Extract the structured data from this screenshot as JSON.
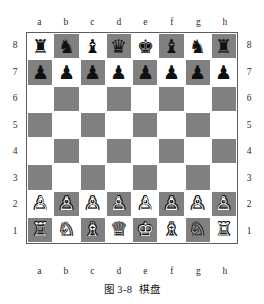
{
  "figure": {
    "caption_number": "图 3-8",
    "caption_title": "棋盘"
  },
  "board": {
    "files": [
      "a",
      "b",
      "c",
      "d",
      "e",
      "f",
      "g",
      "h"
    ],
    "ranks": [
      "8",
      "7",
      "6",
      "5",
      "4",
      "3",
      "2",
      "1"
    ],
    "light_color": "#ffffff",
    "dark_color": "#808080",
    "border_color": "#5e5e5e",
    "orientation": "white-bottom",
    "squares": [
      [
        {
          "square": "a8",
          "shade": "light",
          "piece": "black-rook",
          "glyph": "♜",
          "color": "black"
        },
        {
          "square": "b8",
          "shade": "dark",
          "piece": "black-knight",
          "glyph": "♞",
          "color": "black"
        },
        {
          "square": "c8",
          "shade": "light",
          "piece": "black-bishop",
          "glyph": "♝",
          "color": "black"
        },
        {
          "square": "d8",
          "shade": "dark",
          "piece": "black-queen",
          "glyph": "♛",
          "color": "black"
        },
        {
          "square": "e8",
          "shade": "light",
          "piece": "black-king",
          "glyph": "♚",
          "color": "black"
        },
        {
          "square": "f8",
          "shade": "dark",
          "piece": "black-bishop",
          "glyph": "♝",
          "color": "black"
        },
        {
          "square": "g8",
          "shade": "light",
          "piece": "black-knight",
          "glyph": "♞",
          "color": "black"
        },
        {
          "square": "h8",
          "shade": "dark",
          "piece": "black-rook",
          "glyph": "♜",
          "color": "black"
        }
      ],
      [
        {
          "square": "a7",
          "shade": "dark",
          "piece": "black-pawn",
          "glyph": "♟",
          "color": "black"
        },
        {
          "square": "b7",
          "shade": "light",
          "piece": "black-pawn",
          "glyph": "♟",
          "color": "black"
        },
        {
          "square": "c7",
          "shade": "dark",
          "piece": "black-pawn",
          "glyph": "♟",
          "color": "black"
        },
        {
          "square": "d7",
          "shade": "light",
          "piece": "black-pawn",
          "glyph": "♟",
          "color": "black"
        },
        {
          "square": "e7",
          "shade": "dark",
          "piece": "black-pawn",
          "glyph": "♟",
          "color": "black"
        },
        {
          "square": "f7",
          "shade": "light",
          "piece": "black-pawn",
          "glyph": "♟",
          "color": "black"
        },
        {
          "square": "g7",
          "shade": "dark",
          "piece": "black-pawn",
          "glyph": "♟",
          "color": "black"
        },
        {
          "square": "h7",
          "shade": "light",
          "piece": "black-pawn",
          "glyph": "♟",
          "color": "black"
        }
      ],
      [
        {
          "square": "a6",
          "shade": "light",
          "piece": null,
          "glyph": "",
          "color": null
        },
        {
          "square": "b6",
          "shade": "dark",
          "piece": null,
          "glyph": "",
          "color": null
        },
        {
          "square": "c6",
          "shade": "light",
          "piece": null,
          "glyph": "",
          "color": null
        },
        {
          "square": "d6",
          "shade": "dark",
          "piece": null,
          "glyph": "",
          "color": null
        },
        {
          "square": "e6",
          "shade": "light",
          "piece": null,
          "glyph": "",
          "color": null
        },
        {
          "square": "f6",
          "shade": "dark",
          "piece": null,
          "glyph": "",
          "color": null
        },
        {
          "square": "g6",
          "shade": "light",
          "piece": null,
          "glyph": "",
          "color": null
        },
        {
          "square": "h6",
          "shade": "dark",
          "piece": null,
          "glyph": "",
          "color": null
        }
      ],
      [
        {
          "square": "a5",
          "shade": "dark",
          "piece": null,
          "glyph": "",
          "color": null
        },
        {
          "square": "b5",
          "shade": "light",
          "piece": null,
          "glyph": "",
          "color": null
        },
        {
          "square": "c5",
          "shade": "dark",
          "piece": null,
          "glyph": "",
          "color": null
        },
        {
          "square": "d5",
          "shade": "light",
          "piece": null,
          "glyph": "",
          "color": null
        },
        {
          "square": "e5",
          "shade": "dark",
          "piece": null,
          "glyph": "",
          "color": null
        },
        {
          "square": "f5",
          "shade": "light",
          "piece": null,
          "glyph": "",
          "color": null
        },
        {
          "square": "g5",
          "shade": "dark",
          "piece": null,
          "glyph": "",
          "color": null
        },
        {
          "square": "h5",
          "shade": "light",
          "piece": null,
          "glyph": "",
          "color": null
        }
      ],
      [
        {
          "square": "a4",
          "shade": "light",
          "piece": null,
          "glyph": "",
          "color": null
        },
        {
          "square": "b4",
          "shade": "dark",
          "piece": null,
          "glyph": "",
          "color": null
        },
        {
          "square": "c4",
          "shade": "light",
          "piece": null,
          "glyph": "",
          "color": null
        },
        {
          "square": "d4",
          "shade": "dark",
          "piece": null,
          "glyph": "",
          "color": null
        },
        {
          "square": "e4",
          "shade": "light",
          "piece": null,
          "glyph": "",
          "color": null
        },
        {
          "square": "f4",
          "shade": "dark",
          "piece": null,
          "glyph": "",
          "color": null
        },
        {
          "square": "g4",
          "shade": "light",
          "piece": null,
          "glyph": "",
          "color": null
        },
        {
          "square": "h4",
          "shade": "dark",
          "piece": null,
          "glyph": "",
          "color": null
        }
      ],
      [
        {
          "square": "a3",
          "shade": "dark",
          "piece": null,
          "glyph": "",
          "color": null
        },
        {
          "square": "b3",
          "shade": "light",
          "piece": null,
          "glyph": "",
          "color": null
        },
        {
          "square": "c3",
          "shade": "dark",
          "piece": null,
          "glyph": "",
          "color": null
        },
        {
          "square": "d3",
          "shade": "light",
          "piece": null,
          "glyph": "",
          "color": null
        },
        {
          "square": "e3",
          "shade": "dark",
          "piece": null,
          "glyph": "",
          "color": null
        },
        {
          "square": "f3",
          "shade": "light",
          "piece": null,
          "glyph": "",
          "color": null
        },
        {
          "square": "g3",
          "shade": "dark",
          "piece": null,
          "glyph": "",
          "color": null
        },
        {
          "square": "h3",
          "shade": "light",
          "piece": null,
          "glyph": "",
          "color": null
        }
      ],
      [
        {
          "square": "a2",
          "shade": "light",
          "piece": "white-pawn",
          "glyph": "♙",
          "color": "white"
        },
        {
          "square": "b2",
          "shade": "dark",
          "piece": "white-pawn",
          "glyph": "♙",
          "color": "white"
        },
        {
          "square": "c2",
          "shade": "light",
          "piece": "white-pawn",
          "glyph": "♙",
          "color": "white"
        },
        {
          "square": "d2",
          "shade": "dark",
          "piece": "white-pawn",
          "glyph": "♙",
          "color": "white"
        },
        {
          "square": "e2",
          "shade": "light",
          "piece": "white-pawn",
          "glyph": "♙",
          "color": "white"
        },
        {
          "square": "f2",
          "shade": "dark",
          "piece": "white-pawn",
          "glyph": "♙",
          "color": "white"
        },
        {
          "square": "g2",
          "shade": "light",
          "piece": "white-pawn",
          "glyph": "♙",
          "color": "white"
        },
        {
          "square": "h2",
          "shade": "dark",
          "piece": "white-pawn",
          "glyph": "♙",
          "color": "white"
        }
      ],
      [
        {
          "square": "a1",
          "shade": "dark",
          "piece": "white-rook",
          "glyph": "♖",
          "color": "white"
        },
        {
          "square": "b1",
          "shade": "light",
          "piece": "white-knight",
          "glyph": "♘",
          "color": "white"
        },
        {
          "square": "c1",
          "shade": "dark",
          "piece": "white-bishop",
          "glyph": "♗",
          "color": "white"
        },
        {
          "square": "d1",
          "shade": "light",
          "piece": "white-queen",
          "glyph": "♕",
          "color": "white"
        },
        {
          "square": "e1",
          "shade": "dark",
          "piece": "white-king",
          "glyph": "♔",
          "color": "white"
        },
        {
          "square": "f1",
          "shade": "light",
          "piece": "white-bishop",
          "glyph": "♗",
          "color": "white"
        },
        {
          "square": "g1",
          "shade": "dark",
          "piece": "white-knight",
          "glyph": "♘",
          "color": "white"
        },
        {
          "square": "h1",
          "shade": "light",
          "piece": "white-rook",
          "glyph": "♖",
          "color": "white"
        }
      ]
    ]
  }
}
